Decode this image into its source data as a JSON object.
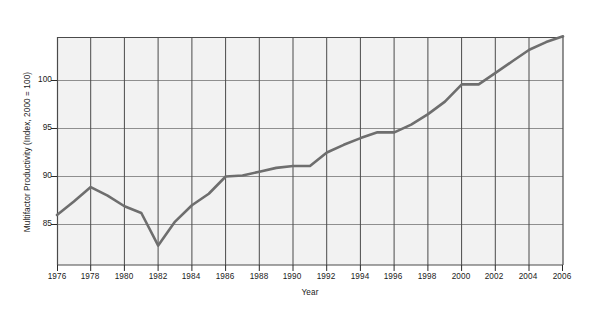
{
  "chart_data": {
    "type": "line",
    "title": "",
    "xlabel": "Year",
    "ylabel": "Multifactor Productivity (Index, 2000 = 100)",
    "xlim": [
      1976,
      2006
    ],
    "ylim": [
      81.5,
      104.5
    ],
    "xticks": [
      "1976",
      "1978",
      "1980",
      "1982",
      "1984",
      "1986",
      "1988",
      "1990",
      "1992",
      "1994",
      "1996",
      "1998",
      "2000",
      "2002",
      "2004",
      "2006"
    ],
    "yticks": [
      "85",
      "90",
      "95",
      "100"
    ],
    "grid": "both",
    "legend": "none",
    "line_color": "#6e6e6e",
    "plot_background": "#f2f2f2",
    "x": [
      1976,
      1977,
      1978,
      1979,
      1980,
      1981,
      1982,
      1983,
      1984,
      1985,
      1986,
      1987,
      1988,
      1989,
      1990,
      1991,
      1992,
      1993,
      1994,
      1995,
      1996,
      1997,
      1998,
      1999,
      2000,
      2001,
      2002,
      2003,
      2004,
      2005,
      2006
    ],
    "values": [
      86.0,
      87.4,
      88.9,
      88.0,
      86.9,
      86.2,
      82.8,
      85.3,
      87.0,
      88.2,
      90.0,
      90.1,
      90.5,
      90.9,
      91.1,
      91.1,
      92.5,
      93.3,
      94.0,
      94.6,
      94.6,
      95.4,
      96.5,
      97.8,
      99.6,
      99.6,
      100.8,
      102.0,
      103.2,
      104.0,
      104.6
    ],
    "series_name": "Multifactor Productivity"
  },
  "axis": {
    "y_label_text": "Multifactor Productivity (Index, 2000 = 100)",
    "x_label_text": "Year"
  },
  "footer": {
    "caption": ""
  }
}
